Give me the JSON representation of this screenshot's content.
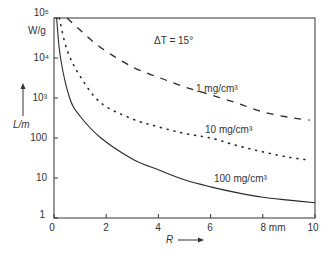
{
  "chart_data": {
    "type": "line",
    "title": "",
    "annotation": "ΔT = 15°",
    "xlabel": "R",
    "x_unit": "mm",
    "ylabel": "L/m",
    "y_unit": "W/g",
    "xlim": [
      0,
      10
    ],
    "ylim": [
      1,
      100000
    ],
    "yscale": "log",
    "grid": false,
    "x_ticks": [
      "0",
      "2",
      "4",
      "6",
      "8 mm",
      "10"
    ],
    "y_ticks": [
      "1",
      "10",
      "100",
      "10³",
      "10⁴",
      "10⁵"
    ],
    "series": [
      {
        "name": "1 mg/cm³",
        "style": "dashed",
        "x": [
          0.5,
          1,
          1.8,
          3,
          4,
          5,
          6,
          7,
          8,
          9,
          9.8
        ],
        "y": [
          100000,
          50000,
          18000,
          6000,
          3300,
          1900,
          1200,
          750,
          450,
          330,
          280
        ]
      },
      {
        "name": "10 mg/cm³",
        "style": "dotted",
        "x": [
          0.2,
          0.5,
          1,
          1.8,
          3,
          4,
          5,
          6,
          7,
          8,
          9,
          9.8
        ],
        "y": [
          100000,
          16000,
          3500,
          750,
          300,
          190,
          130,
          100,
          65,
          45,
          33,
          28
        ]
      },
      {
        "name": "100 mg/cm³",
        "style": "solid",
        "x": [
          0.1,
          0.25,
          0.6,
          1,
          1.8,
          3,
          4,
          5,
          6,
          7,
          8,
          9,
          10
        ],
        "y": [
          100000,
          10000,
          1000,
          350,
          100,
          30,
          16,
          9,
          6,
          4.3,
          3.3,
          2.8,
          2.4
        ]
      }
    ]
  },
  "labels": {
    "annotation": "ΔT = 15°",
    "series_1": "1 mg/cm³",
    "series_2": "10 mg/cm³",
    "series_3": "100 mg/cm³",
    "y_unit": "W/g",
    "y_name": "L/m",
    "x_name": "R",
    "y_ticks": [
      "10⁵",
      "10⁴",
      "10³",
      "100",
      "10",
      "1"
    ],
    "x_ticks": [
      "0",
      "2",
      "4",
      "6",
      "8 mm",
      "10"
    ]
  }
}
